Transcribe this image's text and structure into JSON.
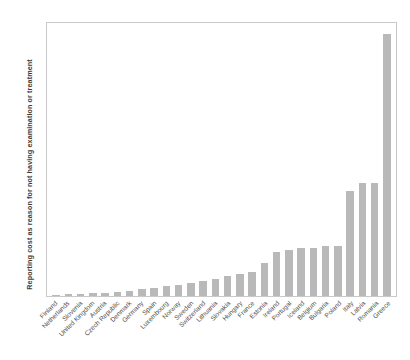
{
  "chart_data": {
    "type": "bar",
    "title": "",
    "subtitle": "",
    "xlabel": "",
    "ylabel": "Reporting cost as reason for not having examination or treatment",
    "ylim": [
      0,
      12.6
    ],
    "ytick_labels": [
      "12%",
      "11%",
      "10%",
      "9%",
      "8%",
      "7%",
      "6%",
      "5%",
      "4%",
      "3%",
      "2%",
      "1%",
      "0%"
    ],
    "ytick_values": [
      12,
      11,
      10,
      9,
      8,
      7,
      6,
      5,
      4,
      3,
      2,
      1,
      0
    ],
    "grid": false,
    "legend": false,
    "bar_color": "#b9b9b9",
    "unit": "%",
    "categories": [
      "Finland",
      "Netherlands",
      "Slovenia",
      "United Kingdom",
      "Austria",
      "Czech Republic",
      "Denmark",
      "Germany",
      "Spain",
      "Luxembourg",
      "Norway",
      "Sweden",
      "Switzerland",
      "Lithuania",
      "Slovakia",
      "Hungary",
      "France",
      "Estonia",
      "Ireland",
      "Portugal",
      "Iceland",
      "Belgium",
      "Bulgaria",
      "Poland",
      "Italy",
      "Latvia",
      "Romania",
      "Greece"
    ],
    "values": [
      0.05,
      0.08,
      0.1,
      0.12,
      0.15,
      0.2,
      0.22,
      0.3,
      0.35,
      0.45,
      0.5,
      0.6,
      0.7,
      0.8,
      0.9,
      1.0,
      1.1,
      1.5,
      2.0,
      2.1,
      2.2,
      2.2,
      2.3,
      2.3,
      4.8,
      5.2,
      5.2,
      12.0
    ]
  }
}
